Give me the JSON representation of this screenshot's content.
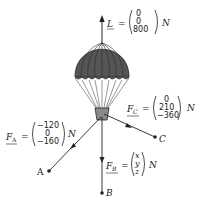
{
  "diagram": {
    "colors": {
      "canopy": "#555555",
      "canopy_dark": "#333333",
      "lines": "#222222",
      "basket": "#8a8a8a"
    },
    "forces": {
      "L": {
        "symbol": "L",
        "components": [
          "0",
          "0",
          "800"
        ],
        "unit": "N"
      },
      "FA": {
        "symbol": "F",
        "subscript": "A",
        "components": [
          "−120",
          "0",
          "−160"
        ],
        "unit": "N"
      },
      "FB": {
        "symbol": "F",
        "subscript": "B",
        "components": [
          "x",
          "y",
          "z"
        ],
        "unit": "N"
      },
      "FC": {
        "symbol": "F",
        "subscript": "C",
        "components": [
          "0",
          "210",
          "−360"
        ],
        "unit": "N"
      }
    },
    "points": {
      "A": "A",
      "B": "B",
      "C": "C"
    },
    "equals": "="
  }
}
